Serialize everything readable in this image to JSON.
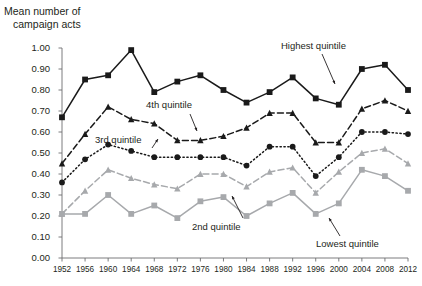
{
  "chart_data": {
    "type": "line",
    "title": "",
    "ylabel": "Mean number of campaign acts",
    "ylabel_line1": "Mean number of",
    "ylabel_line2": "campaign acts",
    "xlabel": "",
    "ylim": [
      0.0,
      1.0
    ],
    "grid": false,
    "legend_position": "inline-annotations",
    "ytick_labels": [
      "1.00",
      "0.90",
      "0.80",
      "0.70",
      "0.60",
      "0.50",
      "0.40",
      "0.30",
      "0.20",
      "0.10",
      "0.00"
    ],
    "ytick_values": [
      1.0,
      0.9,
      0.8,
      0.7,
      0.6,
      0.5,
      0.4,
      0.3,
      0.2,
      0.1,
      0.0
    ],
    "categories": [
      "1952",
      "1956",
      "1960",
      "1964",
      "1968",
      "1972",
      "1976",
      "1980",
      "1984",
      "1988",
      "1992",
      "1996",
      "2000",
      "2004",
      "2008",
      "2012"
    ],
    "series": [
      {
        "name": "Highest quintile",
        "color": "#1a1a1a",
        "marker": "square",
        "line_style": "solid",
        "values": [
          0.67,
          0.85,
          0.87,
          0.99,
          0.79,
          0.84,
          0.87,
          0.8,
          0.74,
          0.79,
          0.86,
          0.76,
          0.73,
          0.9,
          0.92,
          0.8
        ]
      },
      {
        "name": "4th quintile",
        "color": "#1a1a1a",
        "marker": "triangle",
        "line_style": "dashed",
        "values": [
          0.45,
          0.59,
          0.72,
          0.66,
          0.64,
          0.56,
          0.56,
          0.58,
          0.62,
          0.69,
          0.69,
          0.55,
          0.55,
          0.71,
          0.75,
          0.7
        ]
      },
      {
        "name": "3rd quintile",
        "color": "#1a1a1a",
        "marker": "circle",
        "line_style": "dotted",
        "values": [
          0.36,
          0.47,
          0.54,
          0.51,
          0.48,
          0.48,
          0.48,
          0.48,
          0.44,
          0.53,
          0.53,
          0.39,
          0.48,
          0.6,
          0.6,
          0.59
        ]
      },
      {
        "name": "2nd quintile",
        "color": "#a7a9ac",
        "marker": "triangle",
        "line_style": "dashed",
        "values": [
          0.21,
          0.32,
          0.42,
          0.38,
          0.35,
          0.33,
          0.4,
          0.4,
          0.34,
          0.41,
          0.43,
          0.31,
          0.41,
          0.5,
          0.52,
          0.45
        ]
      },
      {
        "name": "Lowest quintile",
        "color": "#a7a9ac",
        "marker": "square",
        "line_style": "solid",
        "values": [
          0.21,
          0.21,
          0.3,
          0.21,
          0.25,
          0.19,
          0.27,
          0.29,
          0.2,
          0.26,
          0.31,
          0.21,
          0.26,
          0.42,
          0.39,
          0.32
        ]
      }
    ],
    "annotations": [
      {
        "name": "Highest quintile",
        "text": "Highest quintile"
      },
      {
        "name": "4th quintile",
        "text": "4th quintile"
      },
      {
        "name": "3rd quintile",
        "text": "3rd quintile"
      },
      {
        "name": "2nd quintile",
        "text": "2nd quintile"
      },
      {
        "name": "Lowest quintile",
        "text": "Lowest quintile"
      }
    ]
  }
}
